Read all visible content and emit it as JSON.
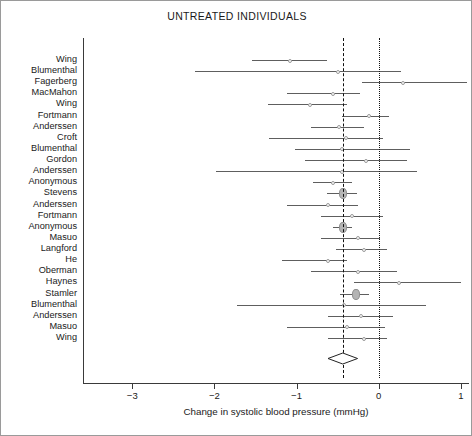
{
  "chart_data": {
    "type": "forest",
    "title": "UNTREATED INDIVIDUALS",
    "xlabel": "Change in systolic blood pressure (mmHg)",
    "ylabel": "",
    "xlim": [
      -3.6,
      1.1
    ],
    "xticks": [
      -3,
      -2,
      -1,
      0,
      1
    ],
    "xticklabels": [
      "−3",
      "−2",
      "−1",
      "0",
      "1"
    ],
    "grid": false,
    "legend": null,
    "reference_lines": [
      {
        "name": "pooled-effect-line",
        "value": -0.44,
        "style": "dashed"
      },
      {
        "name": "null-effect-line",
        "value": 0.0,
        "style": "dotted"
      }
    ],
    "summary": {
      "label": "",
      "estimate": -0.44,
      "ci_low": -0.62,
      "ci_high": -0.26
    },
    "categories": [
      "Wing",
      "Blumenthal",
      "Fagerberg",
      "MacMahon",
      "Wing",
      "Fortmann",
      "Anderssen",
      "Croft",
      "Blumenthal",
      "Gordon",
      "Anderssen",
      "Anonymous",
      "Stevens",
      "Anderssen",
      "Fortmann",
      "Anonymous",
      "Masuo",
      "Langford",
      "He",
      "Oberman",
      "Haynes",
      "Stamler",
      "Blumenthal",
      "Anderssen",
      "Masuo",
      "Wing"
    ],
    "rows": [
      {
        "study": "Wing",
        "estimate": -1.08,
        "ci_low": -1.54,
        "ci_high": -0.63,
        "weight": "small"
      },
      {
        "study": "Blumenthal",
        "estimate": -0.5,
        "ci_low": -2.24,
        "ci_high": 0.27,
        "weight": "small"
      },
      {
        "study": "Fagerberg",
        "estimate": 0.3,
        "ci_low": -0.2,
        "ci_high": 1.08,
        "weight": "small"
      },
      {
        "study": "MacMahon",
        "estimate": -0.55,
        "ci_low": -1.12,
        "ci_high": -0.23,
        "weight": "small"
      },
      {
        "study": "Wing",
        "estimate": -0.83,
        "ci_low": -1.35,
        "ci_high": -0.38,
        "weight": "small"
      },
      {
        "study": "Fortmann",
        "estimate": -0.12,
        "ci_low": -0.45,
        "ci_high": 0.12,
        "weight": "small"
      },
      {
        "study": "Anderssen",
        "estimate": -0.48,
        "ci_low": -0.82,
        "ci_high": -0.18,
        "weight": "small"
      },
      {
        "study": "Croft",
        "estimate": -0.4,
        "ci_low": -1.33,
        "ci_high": 0.05,
        "weight": "small"
      },
      {
        "study": "Blumenthal",
        "estimate": -0.45,
        "ci_low": -1.02,
        "ci_high": 0.38,
        "weight": "small"
      },
      {
        "study": "Gordon",
        "estimate": -0.15,
        "ci_low": -0.9,
        "ci_high": 0.35,
        "weight": "small"
      },
      {
        "study": "Anderssen",
        "estimate": -0.45,
        "ci_low": -1.98,
        "ci_high": 0.47,
        "weight": "small"
      },
      {
        "study": "Anonymous",
        "estimate": -0.55,
        "ci_low": -0.8,
        "ci_high": -0.32,
        "weight": "small"
      },
      {
        "study": "Stevens",
        "estimate": -0.44,
        "ci_low": -0.63,
        "ci_high": -0.26,
        "weight": "large"
      },
      {
        "study": "Anderssen",
        "estimate": -0.62,
        "ci_low": -1.12,
        "ci_high": -0.25,
        "weight": "small"
      },
      {
        "study": "Fortmann",
        "estimate": -0.33,
        "ci_low": -0.7,
        "ci_high": 0.05,
        "weight": "small"
      },
      {
        "study": "Anonymous",
        "estimate": -0.44,
        "ci_low": -0.56,
        "ci_high": -0.32,
        "weight": "large"
      },
      {
        "study": "Masuo",
        "estimate": -0.25,
        "ci_low": -0.7,
        "ci_high": 0.02,
        "weight": "small"
      },
      {
        "study": "Langford",
        "estimate": -0.18,
        "ci_low": -0.52,
        "ci_high": 0.1,
        "weight": "small"
      },
      {
        "study": "He",
        "estimate": -0.62,
        "ci_low": -1.18,
        "ci_high": -0.38,
        "weight": "small"
      },
      {
        "study": "Oberman",
        "estimate": -0.25,
        "ci_low": -0.82,
        "ci_high": 0.22,
        "weight": "small"
      },
      {
        "study": "Haynes",
        "estimate": 0.25,
        "ci_low": -0.3,
        "ci_high": 1.0,
        "weight": "small"
      },
      {
        "study": "Stamler",
        "estimate": -0.28,
        "ci_low": -0.47,
        "ci_high": -0.12,
        "weight": "large"
      },
      {
        "study": "Blumenthal",
        "estimate": -0.42,
        "ci_low": -1.72,
        "ci_high": 0.58,
        "weight": "small"
      },
      {
        "study": "Anderssen",
        "estimate": -0.22,
        "ci_low": -0.62,
        "ci_high": 0.18,
        "weight": "small"
      },
      {
        "study": "Masuo",
        "estimate": -0.38,
        "ci_low": -1.12,
        "ci_high": 0.08,
        "weight": "small"
      },
      {
        "study": "Wing",
        "estimate": -0.18,
        "ci_low": -0.62,
        "ci_high": 0.1,
        "weight": "small"
      }
    ]
  }
}
